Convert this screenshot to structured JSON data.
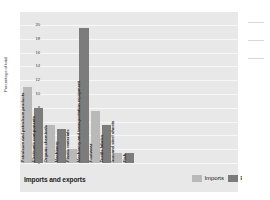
{
  "chart_data": {
    "type": "bar",
    "title": "Imports and exports",
    "xlabel": "",
    "ylabel": "Percentage of total",
    "ylim": [
      0,
      20
    ],
    "yticks": [
      0,
      2,
      4,
      6,
      8,
      10,
      12,
      14,
      16,
      18,
      20
    ],
    "grid": true,
    "legend_position": "bottom-right",
    "legend": [
      {
        "name": "Imports",
        "color": "#b9b9b9"
      },
      {
        "name": "Exports",
        "color": "#7c7c7c"
      }
    ],
    "categories": [
      "Petroleum and petroleum products",
      "Electronic components",
      "Organic chemicals",
      "Machinery",
      "Plastic materials",
      "Machinery and transportation equipment",
      "Footwear",
      "Textile fabrics",
      "Iron and steel sheets",
      "Fish"
    ],
    "values": [
      11,
      8,
      5.5,
      5,
      2,
      19.5,
      7.5,
      5.5,
      1.5,
      1.5
    ],
    "series_of_bar": [
      "Imports",
      "Exports",
      "Imports",
      "Exports",
      "Imports",
      "Exports",
      "Imports",
      "Exports",
      "Imports",
      "Exports"
    ],
    "bars": [
      {
        "label": "Petroleum and petroleum products",
        "value": 11,
        "series": "Imports"
      },
      {
        "label": "Electronic components",
        "value": 8,
        "series": "Exports"
      },
      {
        "label": "Organic chemicals",
        "value": 5.5,
        "series": "Imports"
      },
      {
        "label": "Machinery",
        "value": 5,
        "series": "Exports"
      },
      {
        "label": "Plastic materials",
        "value": 2,
        "series": "Imports"
      },
      {
        "label": "Machinery and transportation equipment",
        "value": 19.5,
        "series": "Exports"
      },
      {
        "label": "Footwear",
        "value": 7.5,
        "series": "Imports"
      },
      {
        "label": "Textile fabrics",
        "value": 5.5,
        "series": "Exports"
      },
      {
        "label": "Iron and steel sheets",
        "value": 1.5,
        "series": "Imports"
      },
      {
        "label": "Fish",
        "value": 1.5,
        "series": "Exports"
      }
    ]
  },
  "colors": {
    "panel_background": "#e8e8e8",
    "gridline": "#f7f7f7",
    "imports": "#b9b9b9",
    "exports": "#7c7c7c",
    "text": "#1c1c1c"
  }
}
